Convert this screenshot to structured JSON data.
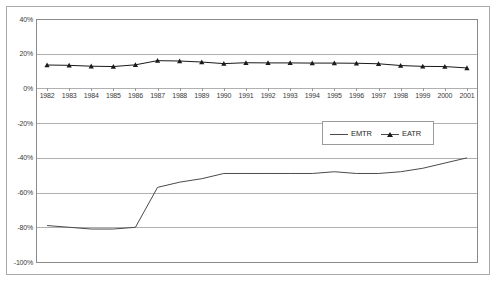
{
  "chart_data": {
    "type": "line",
    "title": "",
    "subtitle": "",
    "xlabel": "",
    "ylabel": "",
    "x": [
      1982,
      1983,
      1984,
      1985,
      1986,
      1987,
      1988,
      1989,
      1990,
      1991,
      1992,
      1993,
      1994,
      1995,
      1996,
      1997,
      1998,
      1999,
      2000,
      2001
    ],
    "categories": [
      "1982",
      "1983",
      "1984",
      "1985",
      "1986",
      "1987",
      "1988",
      "1989",
      "1990",
      "1991",
      "1992",
      "1993",
      "1994",
      "1995",
      "1996",
      "1997",
      "1998",
      "1999",
      "2000",
      "2001"
    ],
    "series": [
      {
        "name": "EMTR",
        "marker": "none",
        "color": "#4a4a4a",
        "values": [
          -79,
          -80,
          -81,
          -81,
          -80,
          -57,
          -54,
          -52,
          -49,
          -49,
          -49,
          -49,
          -49,
          -48,
          -49,
          -49,
          -48,
          -46,
          -43,
          -40
        ]
      },
      {
        "name": "EATR",
        "marker": "triangle",
        "color": "#1a1a1a",
        "values": [
          13.5,
          13.3,
          12.8,
          12.6,
          13.6,
          16.0,
          15.8,
          15.2,
          14.3,
          14.8,
          14.7,
          14.7,
          14.6,
          14.6,
          14.5,
          14.2,
          13.2,
          12.7,
          12.6,
          11.8
        ]
      }
    ],
    "ylim": [
      -100,
      40
    ],
    "ytick_values": [
      40,
      20,
      0,
      -20,
      -40,
      -60,
      -80,
      -100
    ],
    "ytick_labels": [
      "40%",
      "20%",
      "0%",
      "-20%",
      "-40%",
      "-60%",
      "-80%",
      "-100%"
    ],
    "grid": true,
    "grid_axis": "y",
    "legend": {
      "position": "center",
      "entries": [
        "EMTR",
        "EATR"
      ]
    },
    "x_axis_label_position": "zero-line"
  }
}
